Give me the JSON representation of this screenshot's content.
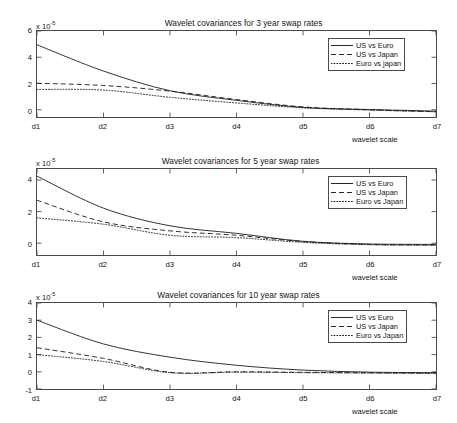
{
  "figure": {
    "width": 457,
    "height": 423,
    "background": "#ffffff",
    "line_color": "#1a1a1a",
    "axis_color": "#4a4a4a"
  },
  "axis_label": "wavelet scale",
  "exponent_text": "x 10",
  "exponent_sup": "-5",
  "chart_data": [
    {
      "type": "line",
      "title": "Wavelet covariances for 3 year swap rates",
      "xlabel": "wavelet scale",
      "ylabel": "",
      "y_multiplier": "x 10^-5",
      "categories": [
        "d1",
        "d2",
        "d3",
        "d4",
        "d5",
        "d6",
        "d7"
      ],
      "x": [
        1,
        2,
        3,
        4,
        5,
        6,
        7
      ],
      "xlim": [
        1,
        7
      ],
      "ylim": [
        -0.55,
        6.0
      ],
      "yticks": [
        0,
        2,
        4,
        6
      ],
      "xticks": [
        "d1",
        "d2",
        "d3",
        "d4",
        "d5",
        "d6",
        "d7"
      ],
      "grid": false,
      "legend_position": "top-right",
      "series": [
        {
          "name": "US vs Euro",
          "style": "solid",
          "values": [
            4.95,
            2.95,
            1.45,
            0.72,
            0.18,
            0.02,
            -0.1
          ]
        },
        {
          "name": "US vs Japan",
          "style": "dashed",
          "values": [
            2.02,
            1.85,
            1.42,
            0.78,
            0.22,
            0.0,
            -0.15
          ]
        },
        {
          "name": "Euro vs japan",
          "style": "dotted",
          "values": [
            1.55,
            1.5,
            0.95,
            0.52,
            0.15,
            -0.02,
            -0.15
          ]
        }
      ]
    },
    {
      "type": "line",
      "title": "Wavelet covariances for 5 year swap rates",
      "xlabel": "wavelet scale",
      "ylabel": "",
      "y_multiplier": "x 10^-5",
      "categories": [
        "d1",
        "d2",
        "d3",
        "d4",
        "d5",
        "d6",
        "d7"
      ],
      "x": [
        1,
        2,
        3,
        4,
        5,
        6,
        7
      ],
      "xlim": [
        1,
        7
      ],
      "ylim": [
        -0.75,
        4.7
      ],
      "yticks": [
        0,
        2,
        4
      ],
      "xticks": [
        "d1",
        "d2",
        "d3",
        "d4",
        "d5",
        "d6",
        "d7"
      ],
      "grid": false,
      "legend_position": "top-right",
      "series": [
        {
          "name": "US vs Euro",
          "style": "solid",
          "values": [
            4.25,
            2.22,
            1.1,
            0.62,
            0.12,
            -0.05,
            -0.08
          ]
        },
        {
          "name": "US vs Japan",
          "style": "dashed",
          "values": [
            2.72,
            1.35,
            0.78,
            0.5,
            0.1,
            -0.08,
            -0.12
          ]
        },
        {
          "name": "Euro vs Japan",
          "style": "dotted",
          "values": [
            1.6,
            1.2,
            0.5,
            0.35,
            0.05,
            -0.1,
            -0.12
          ]
        }
      ]
    },
    {
      "type": "line",
      "title": "Wavelet covariances for 10 year swap rates",
      "xlabel": "wavelet scale",
      "ylabel": "",
      "y_multiplier": "x 10^-5",
      "categories": [
        "d1",
        "d2",
        "d3",
        "d4",
        "d5",
        "d6",
        "d7"
      ],
      "x": [
        1,
        2,
        3,
        4,
        5,
        6,
        7
      ],
      "xlim": [
        1,
        7
      ],
      "ylim": [
        -1.0,
        4.0
      ],
      "yticks": [
        -1,
        0,
        1,
        2,
        3,
        4
      ],
      "xticks": [
        "d1",
        "d2",
        "d3",
        "d4",
        "d5",
        "d6",
        "d7"
      ],
      "grid": false,
      "legend_position": "top-right",
      "series": [
        {
          "name": "US vs Euro",
          "style": "solid",
          "values": [
            3.0,
            1.62,
            0.85,
            0.38,
            0.1,
            -0.02,
            -0.05
          ]
        },
        {
          "name": "US vs Japan",
          "style": "dashed",
          "values": [
            1.4,
            0.78,
            -0.03,
            0.0,
            -0.03,
            -0.06,
            -0.08
          ]
        },
        {
          "name": "Euro vs Japan",
          "style": "dotted",
          "values": [
            1.0,
            0.6,
            -0.05,
            -0.02,
            -0.05,
            -0.07,
            -0.09
          ]
        }
      ]
    }
  ]
}
